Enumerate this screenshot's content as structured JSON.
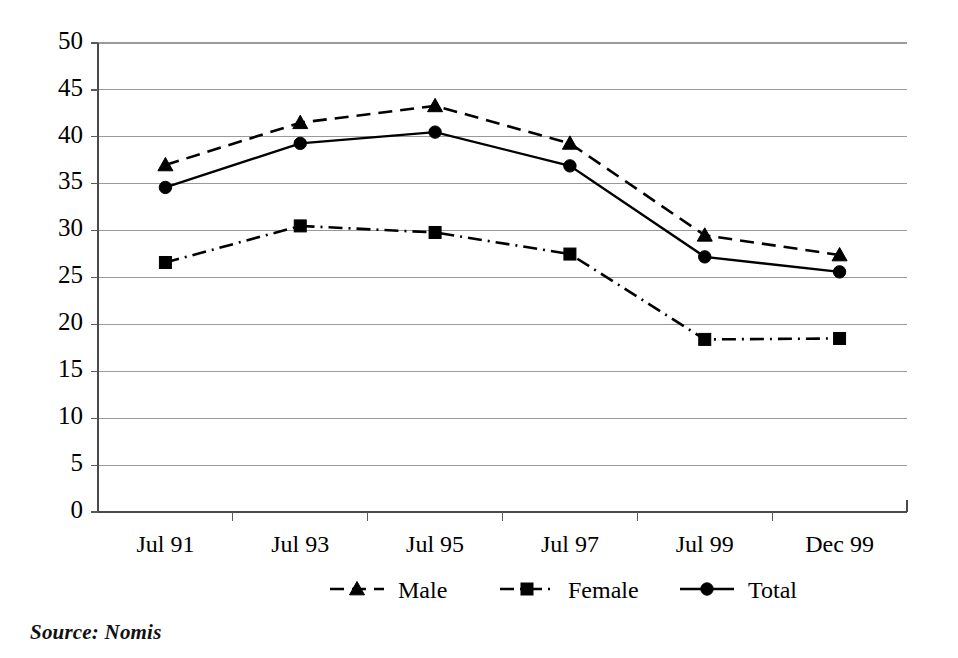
{
  "chart_data": {
    "type": "line",
    "title": "",
    "subtitle": "",
    "xlabel": "",
    "ylabel": "",
    "categories": [
      "Jul 91",
      "Jul 93",
      "Jul 95",
      "Jul 97",
      "Jul 99",
      "Dec 99"
    ],
    "ylim": [
      0,
      50
    ],
    "yticks": [
      0,
      5,
      10,
      15,
      20,
      25,
      30,
      35,
      40,
      45,
      50
    ],
    "grid": "horizontal",
    "legend_position": "bottom",
    "series": [
      {
        "name": "Male",
        "marker": "triangle",
        "linestyle": "dashed",
        "color": "#000000",
        "values": [
          37.0,
          41.5,
          43.3,
          39.3,
          29.5,
          27.4
        ]
      },
      {
        "name": "Female",
        "marker": "square",
        "linestyle": "dash-dot",
        "color": "#000000",
        "values": [
          26.6,
          30.5,
          29.8,
          27.5,
          18.4,
          18.5
        ]
      },
      {
        "name": "Total",
        "marker": "circle",
        "linestyle": "solid",
        "color": "#000000",
        "values": [
          34.6,
          39.3,
          40.5,
          36.9,
          27.2,
          25.6
        ]
      }
    ],
    "annotations": [
      "Source: Nomis"
    ]
  },
  "axis": {
    "y_tick_labels": [
      "50",
      "45",
      "40",
      "35",
      "30",
      "25",
      "20",
      "15",
      "10",
      "5",
      "0"
    ],
    "x_tick_labels": [
      "Jul 91",
      "Jul 93",
      "Jul 95",
      "Jul 97",
      "Jul 99",
      "Dec 99"
    ]
  },
  "legend": {
    "items": [
      {
        "label": "Male",
        "marker": "triangle-icon",
        "linestyle": "dashed"
      },
      {
        "label": "Female",
        "marker": "square-icon",
        "linestyle": "dash-dot"
      },
      {
        "label": "Total",
        "marker": "circle-icon",
        "linestyle": "solid"
      }
    ]
  },
  "footer": {
    "source": "Source: Nomis"
  }
}
